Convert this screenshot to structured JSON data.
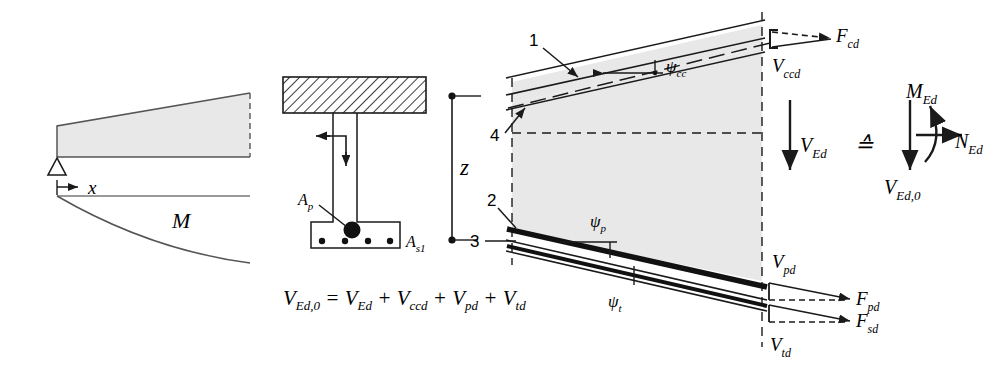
{
  "figure": {
    "fill_color": "#e8e8e8",
    "line_color": "#1a1a1a",
    "background": "#ffffff"
  },
  "left_panel": {
    "name": "shear-and-moment-diagram",
    "support_label": "x",
    "moment_label": "M"
  },
  "section_panel": {
    "name": "cross-section",
    "tendon_label": "A",
    "tendon_sub": "p",
    "rebar_label": "A",
    "rebar_sub": "s1",
    "lever_arm_label": "z"
  },
  "equation": {
    "lhs": "V",
    "lhs_sub": "Ed,0",
    "eq": "=",
    "terms": [
      {
        "sym": "V",
        "sub": "Ed"
      },
      {
        "sym": "V",
        "sub": "ccd"
      },
      {
        "sym": "V",
        "sub": "pd"
      },
      {
        "sym": "V",
        "sub": "td"
      }
    ],
    "plus": "+"
  },
  "main_panel": {
    "name": "beam-web-force-diagram",
    "callouts": [
      {
        "id": "1",
        "meaning": "compression-chord"
      },
      {
        "id": "2",
        "meaning": "prestressing-tendon"
      },
      {
        "id": "3",
        "meaning": "tension-reinforcement"
      },
      {
        "id": "4",
        "meaning": "compression-chord-axis"
      }
    ],
    "angles": [
      {
        "sym": "ψ",
        "sub": "cc",
        "name": "angle-psi-cc"
      },
      {
        "sym": "ψ",
        "sub": "p",
        "name": "angle-psi-p"
      },
      {
        "sym": "ψ",
        "sub": "t",
        "name": "angle-psi-t"
      }
    ],
    "forces": [
      {
        "sym": "F",
        "sub": "cd",
        "name": "force-fcd"
      },
      {
        "sym": "V",
        "sub": "ccd",
        "name": "force-vccd"
      },
      {
        "sym": "V",
        "sub": "Ed",
        "name": "force-ved"
      },
      {
        "sym": "V",
        "sub": "pd",
        "name": "force-vpd"
      },
      {
        "sym": "F",
        "sub": "pd",
        "name": "force-fpd"
      },
      {
        "sym": "F",
        "sub": "sd",
        "name": "force-fsd"
      },
      {
        "sym": "V",
        "sub": "td",
        "name": "force-vtd"
      }
    ]
  },
  "equivalence_panel": {
    "name": "equivalent-section-forces",
    "symbol": "≙",
    "forces": [
      {
        "sym": "M",
        "sub": "Ed",
        "name": "moment-med"
      },
      {
        "sym": "N",
        "sub": "Ed",
        "name": "axial-ned"
      },
      {
        "sym": "V",
        "sub": "Ed,0",
        "name": "shear-ved0"
      }
    ]
  }
}
